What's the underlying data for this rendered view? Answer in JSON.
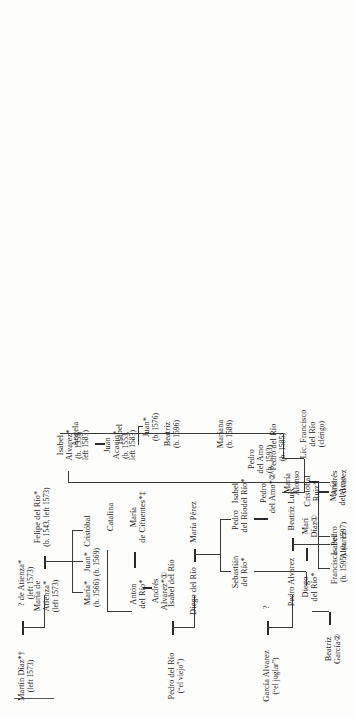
{
  "chart": {
    "kind": "genealogy-tree",
    "orientation": "rotated-90-ccw",
    "footnote_rule": true,
    "nodes": {
      "martin_diaz": {
        "l1": "Martín Díaz*†",
        "l2": "(left 1573)"
      },
      "atienza_q": {
        "l1": "? de Atienza*",
        "l2": "(left 1573)"
      },
      "pedro_rio_viejo": {
        "l1": "Pedro del Río",
        "l2": "(“el viejo”)"
      },
      "isabel_rio": {
        "l1": "Isabel del Río",
        "l2": ""
      },
      "garcia_alvarez": {
        "l1": "García Alvarez",
        "l2": "(“el juglar”)"
      },
      "garcia_wife": {
        "l1": "?",
        "l2": ""
      },
      "pedro_alvarez": {
        "l1": "Pedro Alvarez",
        "l2": ""
      },
      "beatriz_luis": {
        "l1": "Beatriz Luis",
        "l2": ""
      },
      "maria_atienza": {
        "l1": "María de",
        "l2": "Atienza*",
        "l3": "(left 1573)"
      },
      "felipe_rio": {
        "l1": "Felipe del Río*",
        "l2": "(b. 1543, left 1573)"
      },
      "diego_rio": {
        "l1": "Diego del Río",
        "l2": ""
      },
      "maria_perez": {
        "l1": "María Pérez",
        "l2": ""
      },
      "isabel_alvarez1": {
        "l1": "Isabel",
        "l2": "Alvarez"
      },
      "andres_alvarez1": {
        "l1": "Andrés",
        "l2": "Alvarez"
      },
      "maria_alonso": {
        "l1": "María",
        "l2": "Alonso"
      },
      "maria_1566": {
        "l1": "María*",
        "l2": "(b. 1566)"
      },
      "juan_1569": {
        "l1": "Juan*",
        "l2": "(b. 1569)"
      },
      "cristobal": {
        "l1": "Cristóbal",
        "l2": ""
      },
      "beatriz_garcia": {
        "l1": "Beatriz",
        "l2": "García②"
      },
      "diego_rio_s": {
        "l1": "Diego",
        "l2": "del Río*"
      },
      "mari_diaz": {
        "l1": "Mari",
        "l2": "Díaz①"
      },
      "sebastian_rio": {
        "l1": "Sebastián",
        "l2": "del Río*"
      },
      "pedro_rio2": {
        "l1": "Pedro",
        "l2": "del Río"
      },
      "isabel_alvarez2": {
        "l1": "Isabel",
        "l2": "Alvarez"
      },
      "anton_rio": {
        "l1": "Antón",
        "l2": "del Río*"
      },
      "maria_cifuentes": {
        "l1": "María",
        "l2": "de Cifuentes*‡"
      },
      "catalina": {
        "l1": "Catalina",
        "l2": ""
      },
      "juan_acacio": {
        "l1": "Juan",
        "l2": "Acacio*",
        "l3": "(b. 1553,",
        "l4": "left 1583)"
      },
      "isabel_alvarez3": {
        "l1": "Isabel",
        "l2": "Alvarez*",
        "l3": "(b. 1555,",
        "l4": "left 1583)"
      },
      "juan_1576": {
        "l1": "Juan*",
        "l2": "(b. 1576)"
      },
      "pedro_amo": {
        "l1": "Pedro",
        "l2": "del Amo*②"
      },
      "isabel_rio2": {
        "l1": "Isabel",
        "l2": "del Río*"
      },
      "andres_alvarez2": {
        "l1": "Andrés",
        "l2": "Alvarez*①"
      },
      "pedro_amo_b1593": {
        "l1": "Pedro",
        "l2": "del Amo",
        "l3": "(b. 1593)"
      },
      "cristobal_ruiz": {
        "l1": "Cristóbal",
        "l2": "Ruiz*"
      },
      "maria_amo": {
        "l1": "María",
        "l2": "del Amo"
      },
      "lic_francisco": {
        "l1": "Lic. Francisco",
        "l2": "del Río",
        "l3": "(clérigo)"
      },
      "pedro_rio_1585": {
        "l1": "Pedro del Río",
        "l2": "(b. 1585)"
      },
      "mariana_1589": {
        "l1": "Mariana",
        "l2": "(b. 1589)"
      },
      "beatriz_1596": {
        "l1": "Beatriz",
        "l2": "(b. 1596)"
      },
      "isabel_last": {
        "l1": "Isabel",
        "l2": ""
      },
      "angela": {
        "l1": "Angela",
        "l2": ""
      },
      "francisca_1595": {
        "l1": "Francisca",
        "l2": "(b. 1595)"
      },
      "pedro_1597": {
        "l1": "Pedro",
        "l2": "(b. 1597)"
      }
    }
  }
}
